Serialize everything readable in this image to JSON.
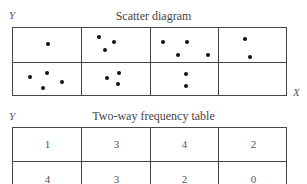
{
  "scatter": {
    "title": "Scatter diagram",
    "y_label": "Y",
    "x_label": "X",
    "rows": 2,
    "cols": 4,
    "counts": [
      [
        1,
        3,
        4,
        2
      ],
      [
        4,
        3,
        2,
        0
      ]
    ],
    "dots": [
      {
        "x": 48,
        "y": 44
      },
      {
        "x": 99,
        "y": 37
      },
      {
        "x": 114,
        "y": 42
      },
      {
        "x": 105,
        "y": 50
      },
      {
        "x": 163,
        "y": 42
      },
      {
        "x": 187,
        "y": 42
      },
      {
        "x": 178,
        "y": 55
      },
      {
        "x": 208,
        "y": 55
      },
      {
        "x": 245,
        "y": 39
      },
      {
        "x": 250,
        "y": 57
      },
      {
        "x": 30,
        "y": 77
      },
      {
        "x": 47,
        "y": 73
      },
      {
        "x": 62,
        "y": 82
      },
      {
        "x": 43,
        "y": 88
      },
      {
        "x": 107,
        "y": 78
      },
      {
        "x": 119,
        "y": 73
      },
      {
        "x": 118,
        "y": 84
      },
      {
        "x": 186,
        "y": 74
      },
      {
        "x": 186,
        "y": 86
      }
    ]
  },
  "table": {
    "title": "Two-way frequency table",
    "y_label": "Y",
    "rows": [
      [
        "1",
        "3",
        "4",
        "2"
      ],
      [
        "4",
        "3",
        "2",
        "0"
      ]
    ]
  },
  "chart_data": {
    "type": "table",
    "xlabel": "X",
    "ylabel": "Y",
    "categories": [
      "col1",
      "col2",
      "col3",
      "col4"
    ],
    "series": [
      {
        "name": "row1 (top)",
        "values": [
          1,
          3,
          4,
          2
        ]
      },
      {
        "name": "row2 (bottom)",
        "values": [
          4,
          3,
          2,
          0
        ]
      }
    ]
  }
}
